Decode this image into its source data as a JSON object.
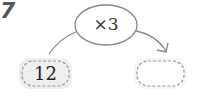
{
  "problem_number": "7",
  "operation": {
    "label": "×3"
  },
  "input_box": {
    "value": "12"
  },
  "output_box": {
    "value": ""
  },
  "colors": {
    "stroke": "#888888",
    "box_fill": "#f0f0f0",
    "text": "#222222"
  }
}
